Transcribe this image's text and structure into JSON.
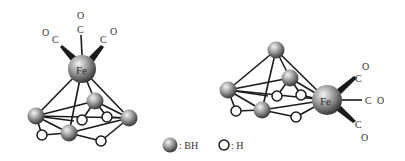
{
  "figure": {
    "left_complex": {
      "metal_label": "Fe",
      "carbonyls": [
        {
          "c": "C",
          "o": "O",
          "position": "top"
        },
        {
          "c": "C",
          "o": "O",
          "position": "upper-left"
        },
        {
          "c": "C",
          "o": "O",
          "position": "upper-right"
        }
      ],
      "bh_count": 4,
      "h_count": 4
    },
    "right_complex": {
      "metal_label": "Fe",
      "carbonyls": [
        {
          "c": "C",
          "o": "O",
          "position": "upper-right"
        },
        {
          "c": "C",
          "o": "O",
          "position": "right"
        },
        {
          "c": "C",
          "o": "O",
          "position": "lower-right"
        }
      ],
      "bh_count": 4,
      "h_count": 4
    },
    "legend": {
      "bh_label": ": BH",
      "h_label": ": H"
    }
  },
  "colors": {
    "line": "#1a1a1a",
    "sphere_light": "#f2f2f2",
    "sphere_dark": "#2a2a2a",
    "text": "#333333"
  }
}
